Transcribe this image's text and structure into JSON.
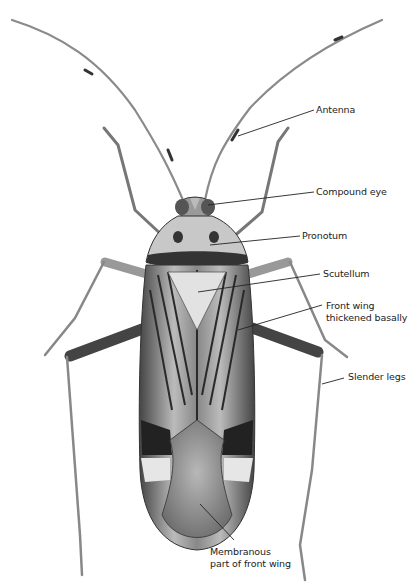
{
  "diagram": {
    "labels": [
      {
        "id": "antenna",
        "text": "Antenna"
      },
      {
        "id": "compound_eye",
        "text": "Compound eye"
      },
      {
        "id": "pronotum",
        "text": "Pronotum"
      },
      {
        "id": "scutellum",
        "text": "Scutellum"
      },
      {
        "id": "front_wing_line1",
        "text": "Front wing"
      },
      {
        "id": "front_wing_line2",
        "text": "thickened basally"
      },
      {
        "id": "slender_legs",
        "text": "Slender legs"
      },
      {
        "id": "membranous_line1",
        "text": "Membranous"
      },
      {
        "id": "membranous_line2",
        "text": "part of front wing"
      }
    ]
  },
  "colors": {
    "background": "#ffffff",
    "dark": "#1e1e1e",
    "mid": "#6a6a6a",
    "light": "#cfcfcf",
    "leader": "#222222"
  }
}
